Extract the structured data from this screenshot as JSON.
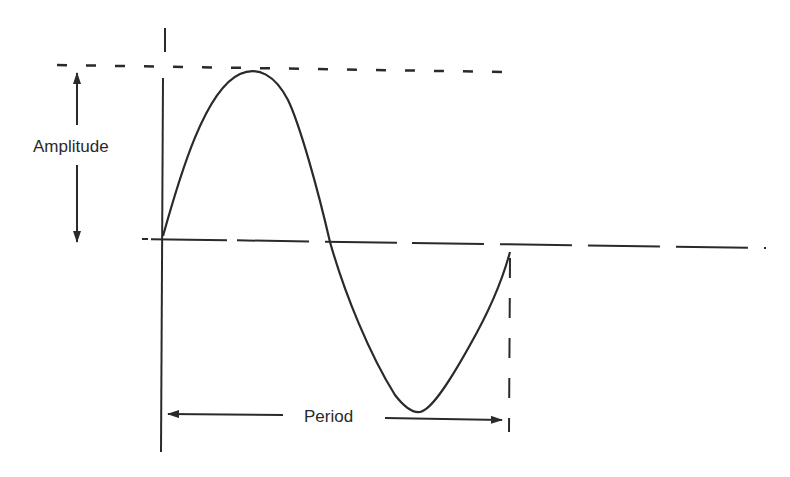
{
  "diagram": {
    "type": "sine-wave",
    "labels": {
      "amplitude": "Amplitude",
      "period": "Period"
    },
    "colors": {
      "stroke": "#2a2a2a",
      "background": "#ffffff"
    },
    "elements": [
      {
        "name": "vertical-axis",
        "kind": "solid-line"
      },
      {
        "name": "peak-reference-line",
        "kind": "dashed-line"
      },
      {
        "name": "baseline",
        "kind": "long-dashed-line"
      },
      {
        "name": "sine-curve",
        "kind": "curve",
        "cycles": 1
      },
      {
        "name": "period-end-line",
        "kind": "dashed-line"
      },
      {
        "name": "amplitude-arrow",
        "kind": "double-arrow",
        "label": "Amplitude"
      },
      {
        "name": "period-arrow",
        "kind": "double-arrow",
        "label": "Period"
      }
    ]
  }
}
